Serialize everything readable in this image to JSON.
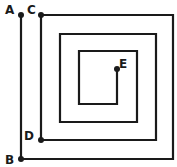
{
  "diagram": {
    "type": "square spiral path",
    "stroke_color": "#1a1a1a",
    "background": "#ffffff",
    "points": {
      "A": {
        "label": "A",
        "x": 21,
        "y": 15
      },
      "B": {
        "label": "B",
        "x": 21,
        "y": 159
      },
      "C": {
        "label": "C",
        "x": 41,
        "y": 15
      },
      "D": {
        "label": "D",
        "x": 41,
        "y": 140
      },
      "E": {
        "label": "E",
        "x": 117,
        "y": 69
      }
    },
    "path": "M21,15 L21,159 L173,159 L173,15 L41,15 L41,140 L156,140 L156,34 L60,34 L60,122 L137,122 L137,51 L79,51 L79,104 L117,104 L117,69"
  }
}
